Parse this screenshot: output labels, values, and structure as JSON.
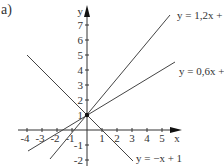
{
  "figure": {
    "panel_label": "a)",
    "axes": {
      "x_label": "x",
      "y_label": "y",
      "x_ticks": [
        "-4",
        "-3",
        "-2",
        "-1",
        "1",
        "2",
        "3",
        "4",
        "5"
      ],
      "y_ticks": [
        "7",
        "6",
        "5",
        "4",
        "3",
        "2",
        "1",
        "-1",
        "-2"
      ]
    },
    "lines": [
      {
        "label": "y = 1,2x +",
        "slope": 1.2,
        "intercept": 1
      },
      {
        "label": "y = 0,6x +",
        "slope": 0.6,
        "intercept": 1
      },
      {
        "label": "y = −x + 1",
        "slope": -1,
        "intercept": 1
      }
    ],
    "intersection_point": {
      "x": 0,
      "y": 1
    }
  }
}
